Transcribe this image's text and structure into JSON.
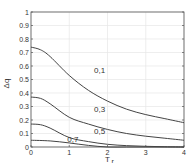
{
  "chart_data": {
    "type": "line",
    "title": "",
    "xlabel": "T_r",
    "ylabel": "Δq",
    "xlim": [
      0,
      4
    ],
    "ylim": [
      0,
      1
    ],
    "grid": true,
    "xticks": [
      "0",
      "1",
      "2",
      "3",
      "4"
    ],
    "yticks": [
      "0",
      "0.1",
      "0.2",
      "0.3",
      "0.4",
      "0.5",
      "0.6",
      "0.7",
      "0.8",
      "0.9",
      "1"
    ],
    "series": [
      {
        "name": "0,1",
        "x": [
          0,
          0.25,
          0.5,
          1,
          1.5,
          2,
          2.5,
          3,
          3.5,
          4
        ],
        "y": [
          0.74,
          0.72,
          0.67,
          0.53,
          0.42,
          0.34,
          0.28,
          0.24,
          0.21,
          0.18
        ]
      },
      {
        "name": "0,3",
        "x": [
          0,
          0.25,
          0.5,
          1,
          1.5,
          2,
          2.5,
          3,
          3.5,
          4
        ],
        "y": [
          0.37,
          0.36,
          0.32,
          0.22,
          0.17,
          0.13,
          0.1,
          0.08,
          0.065,
          0.05
        ]
      },
      {
        "name": "0,5",
        "x": [
          0,
          0.25,
          0.5,
          1,
          1.5,
          2,
          2.5,
          3,
          3.5,
          4
        ],
        "y": [
          0.17,
          0.165,
          0.14,
          0.07,
          0.04,
          0.02,
          0.01,
          0.005,
          0.002,
          0.0
        ]
      },
      {
        "name": "0,7",
        "x": [
          0,
          0.5,
          1,
          1.5,
          2,
          2.5,
          3,
          3.5,
          4
        ],
        "y": [
          0.05,
          0.045,
          0.03,
          0.012,
          0.0,
          0.0,
          0.0,
          0.0,
          0.0
        ]
      }
    ],
    "annotations": [
      {
        "text": "0,1",
        "x": 1.65,
        "y": 0.55
      },
      {
        "text": "0,3",
        "x": 1.65,
        "y": 0.26
      },
      {
        "text": "0,5",
        "x": 1.65,
        "y": 0.1
      },
      {
        "text": "0,7",
        "x": 0.95,
        "y": 0.04
      }
    ],
    "legend": "none"
  }
}
